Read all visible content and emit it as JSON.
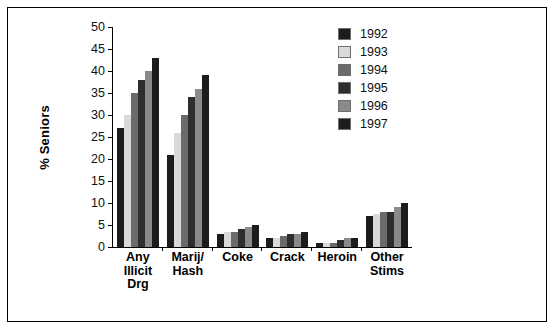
{
  "chart_data": {
    "type": "bar",
    "title": "",
    "xlabel": "",
    "ylabel": "% Seniors",
    "ylim": [
      0,
      50
    ],
    "yticks": [
      0,
      5,
      10,
      15,
      20,
      25,
      30,
      35,
      40,
      45,
      50
    ],
    "grid": false,
    "legend_position": "right",
    "categories": [
      "Any\nIllicit\nDrg",
      "Marij/\nHash",
      "Coke",
      "Crack",
      "Heroin",
      "Other\nStims"
    ],
    "category_lines": [
      [
        "Any",
        "Illicit",
        "Drg"
      ],
      [
        "Marij/",
        "Hash"
      ],
      [
        "Coke"
      ],
      [
        "Crack"
      ],
      [
        "Heroin"
      ],
      [
        "Other",
        "Stims"
      ]
    ],
    "series": [
      {
        "name": "1992",
        "color": "#1c1c1c",
        "values": [
          27,
          21,
          3,
          2,
          1,
          7
        ]
      },
      {
        "name": "1993",
        "color": "#d9d9d9",
        "values": [
          30,
          26,
          3.5,
          2,
          1,
          7.5
        ]
      },
      {
        "name": "1994",
        "color": "#6b6b6b",
        "values": [
          35,
          30,
          3.5,
          2.5,
          1,
          8
        ]
      },
      {
        "name": "1995",
        "color": "#2e2e2e",
        "values": [
          38,
          34,
          4,
          3,
          1.5,
          8
        ]
      },
      {
        "name": "1996",
        "color": "#8a8a8a",
        "values": [
          40,
          36,
          4.5,
          3,
          2,
          9
        ]
      },
      {
        "name": "1997",
        "color": "#1c1c1c",
        "values": [
          43,
          39,
          5,
          3.5,
          2,
          10
        ]
      }
    ]
  }
}
